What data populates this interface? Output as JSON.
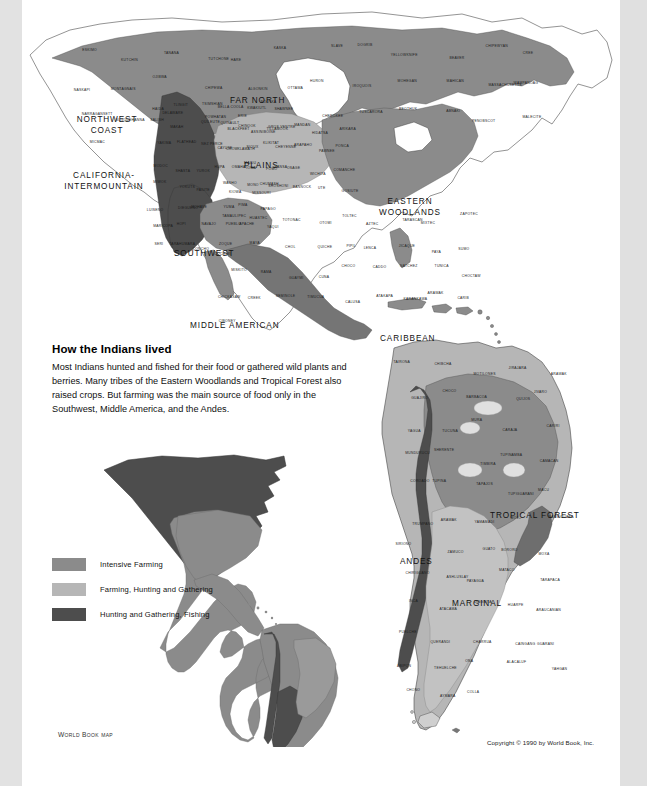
{
  "page": {
    "background": "#ffffff",
    "edge_band_color": "#e2e2e2"
  },
  "article": {
    "heading": "How the Indians lived",
    "body": "Most Indians hunted and fished for their food or gathered wild plants and berries. Many tribes of the Eastern Woodlands and Tropical Forest also raised crops. But farming was the main source of food only in the Southwest, Middle America, and the Andes."
  },
  "legend": {
    "items": [
      {
        "label": "Intensive Farming",
        "color": "#8b8b8b"
      },
      {
        "label": "Farming, Hunting and Gathering",
        "color": "#b6b6b6"
      },
      {
        "label": "Hunting and Gathering, Fishing",
        "color": "#4d4d4d"
      }
    ]
  },
  "credits": {
    "source_small_caps_lead": "W",
    "source": "ORLD ",
    "source2_lead": "B",
    "source2": "OOK ",
    "source_suffix": "map",
    "source_full": "World Book map",
    "copyright": "Copyright © 1990 by World Book, Inc."
  },
  "map": {
    "culture_areas": [
      {
        "name": "FAR NORTH",
        "x": 228,
        "y": 98,
        "color": "#8b8b8b"
      },
      {
        "name": "NORTHWEST COAST",
        "x": 92,
        "y": 120,
        "color": "#4d4d4d"
      },
      {
        "name": "PLAINS",
        "x": 245,
        "y": 164,
        "color": "#b6b6b6"
      },
      {
        "name": "CALIFORNIA-INTERMOUNTAIN",
        "x": 80,
        "y": 175,
        "color": "#4d4d4d"
      },
      {
        "name": "EASTERN WOODLANDS",
        "x": 386,
        "y": 202,
        "color": "#b6b6b6"
      },
      {
        "name": "SOUTHWEST",
        "x": 182,
        "y": 251,
        "color": "#8b8b8b"
      },
      {
        "name": "MIDDLE AMERICAN",
        "x": 230,
        "y": 323,
        "color": "#8b8b8b"
      },
      {
        "name": "CARIBBEAN",
        "x": 405,
        "y": 336,
        "color": "#b6b6b6"
      },
      {
        "name": "TROPICAL FOREST",
        "x": 529,
        "y": 514,
        "color": "#8b8b8b"
      },
      {
        "name": "ANDES",
        "x": 417,
        "y": 559,
        "color": "#4d4d4d"
      },
      {
        "name": "MARGINAL",
        "x": 472,
        "y": 601,
        "color": "#b6b6b6"
      }
    ],
    "tribes_north": [
      "ESKIMO",
      "KUTCHIN",
      "TANANA",
      "TUTCHONE",
      "HARE",
      "KASKA",
      "SLAVE",
      "DOGRIB",
      "YELLOWKNIFE",
      "BEAVER",
      "CHIPEWYAN",
      "CREE",
      "NASKAPI",
      "MONTAGNAIS",
      "OJIBWA",
      "CHIPEWA",
      "ALGONKIN",
      "OTTAWA",
      "HURON",
      "IROQUOIS",
      "MOHEGAN",
      "MAHICAN",
      "MASSACHUSETTS",
      "WAMPANOAG",
      "NARRAGANSETT",
      "SUSQUEHANNA",
      "DELAWARE",
      "POWHATAN",
      "ERIE",
      "SHAWNEE",
      "CHEROKEE",
      "TUSCARORA",
      "BEOTHUK",
      "ABNAKI",
      "PENOBSCOT",
      "MALECITE",
      "MICMAC"
    ],
    "tribes_plains": [
      "BLACKFEET",
      "ASSINIBOINE",
      "GROS VENTRE",
      "MANDAN",
      "HIDATSA",
      "ARIKARA",
      "CROW",
      "SIOUX",
      "CHEYENNE",
      "ARAPAHO",
      "PAWNEE",
      "PONCA",
      "OMAHA",
      "IOWA",
      "KANSA",
      "OSAGE",
      "WICHITA",
      "COMANCHE",
      "KIOWA",
      "MISSOURI",
      "SHOSHONI",
      "BANNOCK",
      "UTE",
      "GOSIUTE"
    ],
    "tribes_west": [
      "HAIDA",
      "TLINGIT",
      "TSIMSHIAN",
      "BELLA COOLA",
      "KWAKIUTL",
      "NOOTKA",
      "SALISH",
      "MAKAH",
      "QUILEUTE",
      "QUINAULT",
      "CHINOOK",
      "TILLAMOOK",
      "YAKIMA",
      "FLATHEAD",
      "NEZ PERCE",
      "CAYUSE",
      "KLAMATH",
      "KLIKITAT",
      "MODOC",
      "SHASTA",
      "YUROK",
      "HUPA",
      "MAIDU",
      "POMO",
      "MIWOK",
      "YOKUTS",
      "PAIUTE",
      "WASHO",
      "MONO",
      "CHUMASH",
      "LUISENO",
      "DIEGUENO",
      "MOHAVE",
      "YUMA",
      "PIMA",
      "PAPAGO",
      "MARICOPA",
      "HOPI",
      "NAVAJO",
      "PUEBLO",
      "APACHE",
      "YAQUI",
      "SERI",
      "TARAHUMARA",
      "CONCHO",
      "COCHIMI"
    ],
    "tribes_middle": [
      "TAMAULIPEC",
      "HUASTEC",
      "TOTONAC",
      "OTOMI",
      "TOLTEC",
      "AZTEC",
      "TARASCAN",
      "MIXTEC",
      "ZAPOTEC",
      "ZOQUE",
      "MAYA",
      "CHOL",
      "QUICHE",
      "PIPIL",
      "LENCA",
      "JICAQUE",
      "PAYA",
      "SUMO",
      "MISKITO",
      "RAMA",
      "GUAYMI",
      "CUNA",
      "CHOCO",
      "CADDO",
      "NATCHEZ",
      "TUNICA",
      "CHOCTAW",
      "CHICKASAW",
      "CREEK",
      "SEMINOLE",
      "TIMUCUA",
      "CALUSA",
      "ATAKAPA",
      "KARANKAWA",
      "ARAWAK",
      "CARIB",
      "CIBONEY"
    ],
    "tribes_south": [
      "TAIRONA",
      "CHIBCHA",
      "MOTILONES",
      "JIRAJARA",
      "ARAWAK",
      "GUAJIRO",
      "CHOCO",
      "BARBACOA",
      "QUIJOS",
      "JIVARO",
      "YAGUA",
      "TUCUNA",
      "MURA",
      "CARAJA",
      "CARIRI",
      "MUNDURUCU",
      "SHERENTE",
      "TIMBIRA",
      "TUPINAMBA",
      "CAMACAN",
      "COROADO",
      "TUPINA",
      "TAPAJOS",
      "TUPIGUARANI",
      "MACU",
      "TRUMPANO",
      "ARAWAK",
      "YAMAMADI",
      "MOJO",
      "NAMBICUARA",
      "SIRIONO",
      "ZAMUCO",
      "GUATO",
      "BORORO",
      "MOXA",
      "CHIRIGUANO",
      "ASHLUSLAY",
      "PAYAGUA",
      "MATACO",
      "TARAPACA",
      "INCA",
      "ATACAMA",
      "DIAGUITA",
      "HUARPE",
      "ARAUCANIAN",
      "PUELCHE",
      "QUERANDI",
      "CHARRUA",
      "CAINGANG",
      "GUARANI",
      "ABIPON",
      "TEHUELCHE",
      "ONA",
      "ALACALUF",
      "YAHGAN",
      "CHONO",
      "AYMARA",
      "COLLA"
    ]
  }
}
